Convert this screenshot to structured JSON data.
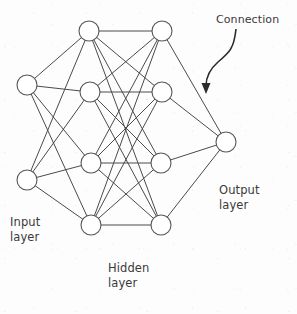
{
  "diagram": {
    "type": "node-link-diagram",
    "background_color": "#fdfdfd",
    "edge_color": "#4a4a4a",
    "node_fill_color": "#ffffff",
    "node_stroke_color": "#555555",
    "pointer_color": "#2b2b2b"
  },
  "labels": {
    "input_layer_line1": "Input",
    "input_layer_line2": "layer",
    "hidden_layer_line1": "Hidden",
    "hidden_layer_line2": "layer",
    "output_layer_line1": "Output",
    "output_layer_line2": "layer",
    "connection": "Connection"
  },
  "chart_data": {
    "type": "diagram",
    "layers": [
      {
        "name": "Input layer",
        "id": "input",
        "node_count": 2,
        "nodes": [
          {
            "id": "i1",
            "cx": 27,
            "cy": 85,
            "r": 10
          },
          {
            "id": "i2",
            "cx": 27,
            "cy": 180,
            "r": 10
          }
        ]
      },
      {
        "name": "Hidden layer column 1",
        "id": "hidden1",
        "node_count": 4,
        "nodes": [
          {
            "id": "h1a",
            "cx": 89,
            "cy": 31,
            "r": 10
          },
          {
            "id": "h1b",
            "cx": 90,
            "cy": 92,
            "r": 10
          },
          {
            "id": "h1c",
            "cx": 91,
            "cy": 163,
            "r": 10
          },
          {
            "id": "h1d",
            "cx": 91,
            "cy": 225,
            "r": 10
          }
        ]
      },
      {
        "name": "Hidden layer column 2",
        "id": "hidden2",
        "node_count": 4,
        "nodes": [
          {
            "id": "h2a",
            "cx": 162,
            "cy": 31,
            "r": 10
          },
          {
            "id": "h2b",
            "cx": 162,
            "cy": 92,
            "r": 10
          },
          {
            "id": "h2c",
            "cx": 161,
            "cy": 163,
            "r": 10
          },
          {
            "id": "h2d",
            "cx": 161,
            "cy": 225,
            "r": 10
          }
        ]
      },
      {
        "name": "Output layer",
        "id": "output",
        "node_count": 1,
        "nodes": [
          {
            "id": "o1",
            "cx": 226,
            "cy": 142,
            "r": 10
          }
        ]
      }
    ],
    "edges": [
      {
        "from": "i1",
        "to": "h1a"
      },
      {
        "from": "i1",
        "to": "h1b"
      },
      {
        "from": "i1",
        "to": "h1c"
      },
      {
        "from": "i1",
        "to": "h1d"
      },
      {
        "from": "i2",
        "to": "h1a"
      },
      {
        "from": "i2",
        "to": "h1b"
      },
      {
        "from": "i2",
        "to": "h1c"
      },
      {
        "from": "i2",
        "to": "h1d"
      },
      {
        "from": "h1a",
        "to": "h2a"
      },
      {
        "from": "h1a",
        "to": "h2b"
      },
      {
        "from": "h1a",
        "to": "h2c"
      },
      {
        "from": "h1a",
        "to": "h2d"
      },
      {
        "from": "h1b",
        "to": "h2a"
      },
      {
        "from": "h1b",
        "to": "h2b"
      },
      {
        "from": "h1b",
        "to": "h2c"
      },
      {
        "from": "h1b",
        "to": "h2d"
      },
      {
        "from": "h1c",
        "to": "h2a"
      },
      {
        "from": "h1c",
        "to": "h2b"
      },
      {
        "from": "h1c",
        "to": "h2c"
      },
      {
        "from": "h1c",
        "to": "h2d"
      },
      {
        "from": "h1d",
        "to": "h2a"
      },
      {
        "from": "h1d",
        "to": "h2b"
      },
      {
        "from": "h1d",
        "to": "h2c"
      },
      {
        "from": "h1d",
        "to": "h2d"
      },
      {
        "from": "h2a",
        "to": "o1"
      },
      {
        "from": "h2b",
        "to": "o1"
      },
      {
        "from": "h2c",
        "to": "o1"
      },
      {
        "from": "h2d",
        "to": "o1"
      }
    ],
    "annotations": [
      {
        "text": "Connection",
        "label_x": 216,
        "label_y": 12,
        "pointer_start_x": 236,
        "pointer_start_y": 29,
        "pointer_end_x": 206,
        "pointer_end_y": 92,
        "target": "edge h2a-o1"
      }
    ]
  }
}
